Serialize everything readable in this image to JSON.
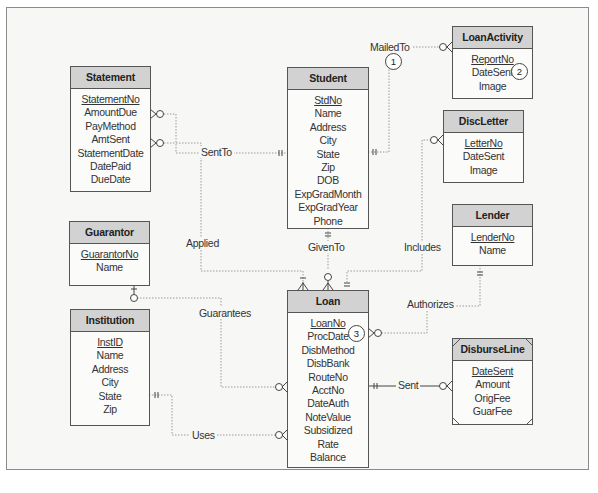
{
  "diagram": {
    "type": "entity-relationship (crow's foot)",
    "entities": [
      {
        "name": "Statement",
        "attributes": [
          {
            "label": "StatementNo",
            "pk": true
          },
          {
            "label": "AmountDue"
          },
          {
            "label": "PayMethod"
          },
          {
            "label": "AmtSent"
          },
          {
            "label": "StatementDate"
          },
          {
            "label": "DatePaid"
          },
          {
            "label": "DueDate"
          }
        ]
      },
      {
        "name": "Student",
        "attributes": [
          {
            "label": "StdNo",
            "pk": true
          },
          {
            "label": "Name"
          },
          {
            "label": "Address"
          },
          {
            "label": "City"
          },
          {
            "label": "State"
          },
          {
            "label": "Zip"
          },
          {
            "label": "DOB"
          },
          {
            "label": "ExpGradMonth"
          },
          {
            "label": "ExpGradYear"
          },
          {
            "label": "Phone"
          }
        ]
      },
      {
        "name": "LoanActivity",
        "attributes": [
          {
            "label": "ReportNo",
            "pk": true
          },
          {
            "label": "DateSent"
          },
          {
            "label": "Image"
          }
        ]
      },
      {
        "name": "DiscLetter",
        "attributes": [
          {
            "label": "LetterNo",
            "pk": true
          },
          {
            "label": "DateSent"
          },
          {
            "label": "Image"
          }
        ]
      },
      {
        "name": "Lender",
        "attributes": [
          {
            "label": "LenderNo",
            "pk": true
          },
          {
            "label": "Name"
          }
        ]
      },
      {
        "name": "Guarantor",
        "attributes": [
          {
            "label": "GuarantorNo",
            "pk": true
          },
          {
            "label": "Name"
          }
        ]
      },
      {
        "name": "Institution",
        "attributes": [
          {
            "label": "InstID",
            "pk": true
          },
          {
            "label": "Name"
          },
          {
            "label": "Address"
          },
          {
            "label": "City"
          },
          {
            "label": "State"
          },
          {
            "label": "Zip"
          }
        ]
      },
      {
        "name": "Loan",
        "attributes": [
          {
            "label": "LoanNo",
            "pk": true
          },
          {
            "label": "ProcDate"
          },
          {
            "label": "DisbMethod"
          },
          {
            "label": "DisbBank"
          },
          {
            "label": "RouteNo"
          },
          {
            "label": "AcctNo"
          },
          {
            "label": "DateAuth"
          },
          {
            "label": "NoteValue"
          },
          {
            "label": "Subsidized"
          },
          {
            "label": "Rate"
          },
          {
            "label": "Balance"
          }
        ]
      },
      {
        "name": "DisburseLine",
        "weak": true,
        "attributes": [
          {
            "label": "DateSent",
            "pk": true
          },
          {
            "label": "Amount"
          },
          {
            "label": "OrigFee"
          },
          {
            "label": "GuarFee"
          }
        ]
      }
    ],
    "relationships": [
      {
        "label": "SentTo",
        "from": "Student",
        "to": "Statement"
      },
      {
        "label": "MailedTo",
        "from": "Student",
        "to": "LoanActivity"
      },
      {
        "label": "Applied",
        "from": "Statement",
        "to": "Loan"
      },
      {
        "label": "GivenTo",
        "from": "Student",
        "to": "Loan"
      },
      {
        "label": "Includes",
        "from": "Loan",
        "to": "DiscLetter"
      },
      {
        "label": "Authorizes",
        "from": "Lender",
        "to": "Loan"
      },
      {
        "label": "Guarantees",
        "from": "Guarantor",
        "to": "Loan"
      },
      {
        "label": "Uses",
        "from": "Institution",
        "to": "Loan"
      },
      {
        "label": "Sent",
        "from": "Loan",
        "to": "DisburseLine",
        "identifying": true
      }
    ],
    "callouts": [
      "1",
      "2",
      "3"
    ]
  }
}
